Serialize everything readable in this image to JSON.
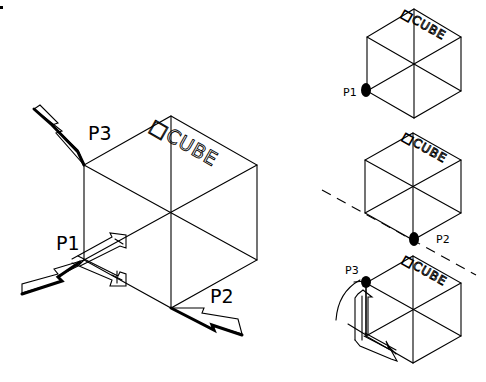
{
  "main_figure": {
    "cube_label": "□CUBE",
    "points": [
      {
        "id": "p3",
        "label": "P3"
      },
      {
        "id": "p1",
        "label": "P1"
      },
      {
        "id": "p2",
        "label": "P2"
      }
    ]
  },
  "side_figures": [
    {
      "cube_label": "□CUBE",
      "point_label": "P1"
    },
    {
      "cube_label": "□CUBE",
      "point_label": "P2"
    },
    {
      "cube_label": "□CUBE",
      "point_label": "P3"
    }
  ],
  "colors": {
    "line": "#000000",
    "background": "#ffffff"
  }
}
